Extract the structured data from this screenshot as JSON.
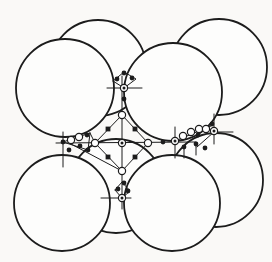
{
  "figure": {
    "background": "#faf9f7",
    "sphere_fill": "#fdfdfc",
    "ink": "#1c1c1c",
    "canvas": {
      "width": 272,
      "height": 262
    },
    "spheres": {
      "stroke_width": 1.8,
      "back": [
        {
          "cx": 98,
          "cy": 68,
          "r": 48
        },
        {
          "cx": 219,
          "cy": 67,
          "r": 48
        },
        {
          "cx": 116,
          "cy": 186,
          "r": 47
        },
        {
          "cx": 216,
          "cy": 180,
          "r": 47
        }
      ],
      "front": [
        {
          "cx": 65,
          "cy": 88,
          "r": 49
        },
        {
          "cx": 173,
          "cy": 92,
          "r": 49
        },
        {
          "cx": 62,
          "cy": 203,
          "r": 48
        },
        {
          "cx": 172,
          "cy": 203,
          "r": 48
        }
      ]
    },
    "lines": {
      "stroke_width": 1,
      "segments": [
        {
          "name": "horizontal-axis",
          "pts": [
            [
              56,
              143
            ],
            [
              196,
              142
            ]
          ]
        },
        {
          "name": "vertical-axis",
          "pts": [
            [
              122,
              76
            ],
            [
              122,
              209
            ]
          ]
        },
        {
          "name": "octahedron-outline",
          "pts": [
            [
              122,
              115
            ],
            [
              95,
              143
            ],
            [
              122,
              171
            ],
            [
              148,
              143
            ],
            [
              122,
              115
            ]
          ]
        },
        {
          "name": "top-tick",
          "pts": [
            [
              107,
              88
            ],
            [
              142,
              88
            ]
          ]
        },
        {
          "name": "bottom-tick",
          "pts": [
            [
              101,
              198
            ],
            [
              131,
              198
            ]
          ]
        },
        {
          "name": "left-tick",
          "pts": [
            [
              63,
              132
            ],
            [
              63,
              167
            ]
          ]
        },
        {
          "name": "right-tick",
          "pts": [
            [
              175,
              127
            ],
            [
              175,
              158
            ]
          ]
        },
        {
          "name": "back-right-tick",
          "pts": [
            [
              214,
              114
            ],
            [
              214,
              144
            ]
          ]
        },
        {
          "name": "back-right-arm",
          "pts": [
            [
              214,
              132
            ],
            [
              233,
              132
            ]
          ]
        },
        {
          "name": "right-chain",
          "pts": [
            [
              175,
              141
            ],
            [
              211,
              126
            ]
          ]
        },
        {
          "name": "right-lower-link",
          "pts": [
            [
              214,
              132
            ],
            [
              197,
              147
            ]
          ]
        },
        {
          "name": "left-chain",
          "pts": [
            [
              63,
              142
            ],
            [
              90,
              133
            ]
          ]
        },
        {
          "name": "left-return",
          "pts": [
            [
              90,
              133
            ],
            [
              95,
              143
            ]
          ]
        },
        {
          "name": "left-close",
          "pts": [
            [
              90,
              133
            ],
            [
              88,
              150
            ]
          ]
        },
        {
          "name": "left-lower-link",
          "pts": [
            [
              63,
              142
            ],
            [
              88,
              150
            ]
          ]
        },
        {
          "name": "left-diagonal",
          "pts": [
            [
              71,
              144
            ],
            [
              120,
              170
            ]
          ]
        },
        {
          "name": "top-fan",
          "pts": [
            [
              113,
              81
            ],
            [
              124,
              72
            ],
            [
              136,
              79
            ],
            [
              124,
              88
            ],
            [
              113,
              81
            ]
          ]
        },
        {
          "name": "bottom-fan",
          "pts": [
            [
              115,
              190
            ],
            [
              122,
              182
            ],
            [
              130,
              191
            ],
            [
              122,
              198
            ],
            [
              115,
              190
            ]
          ]
        },
        {
          "name": "right-dangle-1",
          "pts": [
            [
              184,
              147
            ],
            [
              184,
              158
            ]
          ]
        },
        {
          "name": "right-dangle-2",
          "pts": [
            [
              196,
              144
            ],
            [
              196,
              155
            ]
          ]
        }
      ]
    },
    "open_sites": {
      "r": 3.6,
      "stroke_width": 1.2,
      "positions": [
        [
          122,
          115
        ],
        [
          95,
          143
        ],
        [
          148,
          143
        ],
        [
          122,
          171
        ],
        [
          71,
          140
        ],
        [
          79,
          137
        ],
        [
          183,
          136
        ],
        [
          191,
          132
        ],
        [
          199,
          129
        ],
        [
          206,
          129
        ]
      ]
    },
    "ring_sites": {
      "r": 3.6,
      "dot_r": 1.5,
      "stroke_width": 1.2,
      "positions": [
        [
          122,
          143
        ],
        [
          124,
          88
        ],
        [
          122,
          198
        ],
        [
          175,
          141
        ],
        [
          214,
          131
        ]
      ]
    },
    "square_sites": {
      "size": 4.8,
      "positions": [
        [
          108,
          129
        ],
        [
          135,
          129
        ],
        [
          108,
          157
        ],
        [
          135,
          157
        ]
      ]
    },
    "dot_sites": {
      "r": 2.4,
      "positions": [
        [
          124,
          73
        ],
        [
          117,
          79
        ],
        [
          132,
          78
        ],
        [
          124,
          99
        ],
        [
          124,
          183
        ],
        [
          118,
          189
        ],
        [
          128,
          191
        ],
        [
          63,
          142
        ],
        [
          69,
          150
        ],
        [
          80,
          146
        ],
        [
          87,
          135
        ],
        [
          88,
          150
        ],
        [
          163,
          142
        ],
        [
          184,
          147
        ],
        [
          196,
          144
        ],
        [
          205,
          148
        ],
        [
          212,
          124
        ],
        [
          198,
          135
        ]
      ]
    }
  }
}
